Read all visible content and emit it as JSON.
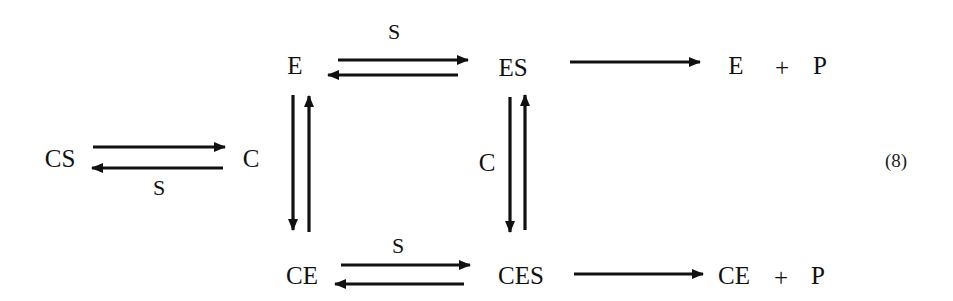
{
  "diagram": {
    "type": "reaction-scheme",
    "species": {
      "E": "E",
      "ES": "ES",
      "E_plus_P": {
        "left": "E",
        "plus": "+",
        "right": "P"
      },
      "CS": "CS",
      "C": "C",
      "CE": "CE",
      "CES": "CES",
      "CE_plus_P": {
        "left": "CE",
        "plus": "+",
        "right": "P"
      }
    },
    "arrow_labels": {
      "E_ES": "S",
      "CS_C": "S",
      "ES_CES": "C",
      "CE_CES": "S"
    },
    "equation_number": "(8)",
    "edges": [
      {
        "from": "E",
        "to": "ES",
        "type": "reversible",
        "label": "S"
      },
      {
        "from": "ES",
        "to": "E + P",
        "type": "forward"
      },
      {
        "from": "CS",
        "to": "C",
        "type": "reversible",
        "label": "S"
      },
      {
        "from": "E",
        "to": "CE",
        "type": "reversible"
      },
      {
        "from": "ES",
        "to": "CES",
        "type": "reversible",
        "label": "C"
      },
      {
        "from": "CE",
        "to": "CES",
        "type": "reversible",
        "label": "S"
      },
      {
        "from": "CES",
        "to": "CE + P",
        "type": "forward"
      }
    ],
    "colors": {
      "ink": "#111111",
      "background": "#ffffff"
    }
  }
}
